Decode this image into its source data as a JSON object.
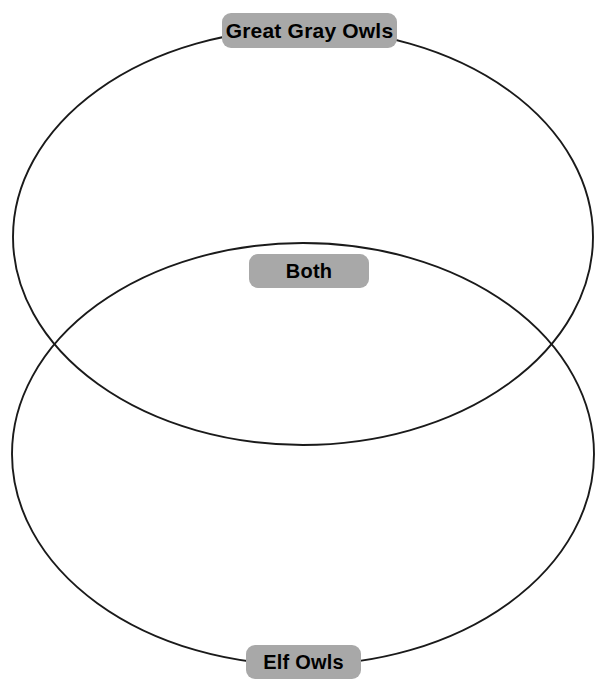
{
  "diagram": {
    "type": "venn",
    "title": "",
    "canvas": {
      "width": 607,
      "height": 691,
      "background": "#ffffff"
    },
    "stroke_color": "#1a1a1a",
    "label_background": "#a8a8a8",
    "label_text_color": "#000000",
    "sets": [
      {
        "id": "set-a",
        "label": "Great Gray Owls",
        "position": "top",
        "ellipse": {
          "cx": 303,
          "cy": 237,
          "rx": 290,
          "ry": 208
        },
        "items": []
      },
      {
        "id": "set-b",
        "label": "Elf Owls",
        "position": "bottom",
        "ellipse": {
          "cx": 303,
          "cy": 454,
          "rx": 291,
          "ry": 211
        },
        "items": []
      }
    ],
    "intersection": {
      "id": "intersection",
      "label": "Both",
      "position": "middle",
      "items": []
    }
  }
}
